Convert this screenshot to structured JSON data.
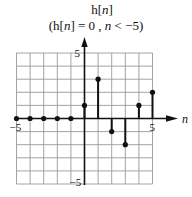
{
  "chart_data": {
    "type": "stem",
    "title": "h[n]",
    "subtitle": "(h[n] = 0 , n < −5)",
    "xlabel": "n",
    "ylabel": "",
    "x": [
      -5,
      -4,
      -3,
      -2,
      -1,
      0,
      1,
      2,
      3,
      4,
      5
    ],
    "values": [
      0,
      0,
      0,
      0,
      0,
      1,
      3,
      -1,
      -2,
      1,
      2
    ],
    "xlim": [
      -5,
      5
    ],
    "ylim": [
      -5,
      5
    ],
    "x_tick_labels": [
      "−5",
      "5"
    ],
    "y_tick_labels": [
      "5",
      "−5"
    ],
    "grid": true,
    "colors": {
      "stem": "#111111",
      "grid": "#9a9a9a",
      "axis": "#111111"
    }
  },
  "labels": {
    "title_prefix": "h[",
    "title_var": "n",
    "title_suffix": "]",
    "sub_open": "(h[",
    "sub_var": "n",
    "sub_mid": "] = 0 , ",
    "sub_var2": "n",
    "sub_end": " < −5)"
  }
}
